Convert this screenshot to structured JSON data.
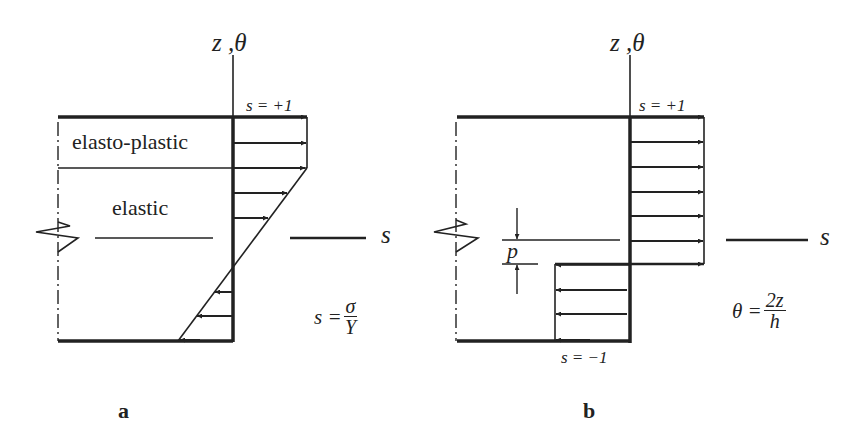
{
  "figure": {
    "panels": [
      {
        "id": "a",
        "label": "a",
        "axis_label": "z ,θ",
        "top_value": "s = +1",
        "horizontal_axis_label": "s",
        "region_labels": [
          "elasto-plastic",
          "elastic"
        ],
        "formula": {
          "lhs": "s =",
          "numerator": "σ",
          "denominator": "Y"
        },
        "distribution": "elastic-perfectly plastic stress profile (linear in elastic core, capped at s=+1 in elasto-plastic zone)"
      },
      {
        "id": "b",
        "label": "b",
        "axis_label": "z ,θ",
        "top_value": "s = +1",
        "bottom_value": "s = −1",
        "horizontal_axis_label": "s",
        "offset_label": "p",
        "formula": {
          "lhs": "θ =",
          "numerator": "2z",
          "denominator": "h"
        },
        "distribution": "fully plastic stress profile (s=+1 above neutral offset, s=−1 below)"
      }
    ],
    "colors": {
      "line": "#222222",
      "background": "#ffffff"
    }
  }
}
